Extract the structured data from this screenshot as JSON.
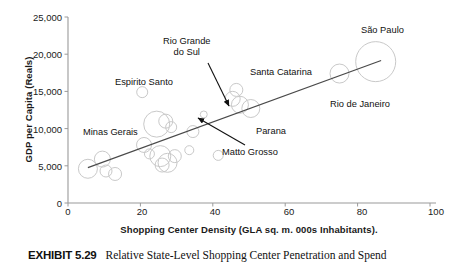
{
  "exhibit": {
    "label": "EXHIBIT 5.29",
    "caption": "Relative State-Level Shopping Center Penetration and Spend"
  },
  "chart_data": {
    "type": "scatter",
    "title": "",
    "xlabel": "Shopping Center Density (GLA sq. m. 000s Inhabitants).",
    "ylabel": "GDP per Capita (Reals)",
    "xlim": [
      0,
      100
    ],
    "ylim": [
      0,
      25000
    ],
    "xticks": [
      "0",
      "20",
      "40",
      "60",
      "80",
      "100"
    ],
    "xtick_values": [
      0,
      20,
      40,
      60,
      80,
      100
    ],
    "yticks": [
      "0",
      "5,000",
      "10,000",
      "15,000",
      "20,000",
      "25,000"
    ],
    "ytick_values": [
      0,
      5000,
      10000,
      15000,
      20000,
      25000
    ],
    "grid": false,
    "legend": "none",
    "bubble_color": "#c9c9c9",
    "trendline_color": "#4a4a4a",
    "series": [
      {
        "name": "Brazilian states",
        "marker": "open-circle",
        "points": [
          {
            "x": 5.5,
            "y": 4600,
            "r": 9.5
          },
          {
            "x": 9.5,
            "y": 5900,
            "r": 8.0
          },
          {
            "x": 10.5,
            "y": 4300,
            "r": 6.0
          },
          {
            "x": 13.0,
            "y": 3900,
            "r": 6.5
          },
          {
            "x": 20.5,
            "y": 14900,
            "r": 5.5
          },
          {
            "x": 21.0,
            "y": 7800,
            "r": 7.5
          },
          {
            "x": 22.5,
            "y": 6600,
            "r": 5.0
          },
          {
            "x": 24.5,
            "y": 10600,
            "r": 13.0
          },
          {
            "x": 25.5,
            "y": 6300,
            "r": 10.5
          },
          {
            "x": 26.0,
            "y": 5100,
            "r": 7.0
          },
          {
            "x": 27.0,
            "y": 11000,
            "r": 7.0
          },
          {
            "x": 27.5,
            "y": 5400,
            "r": 9.5
          },
          {
            "x": 28.5,
            "y": 10200,
            "r": 5.5
          },
          {
            "x": 29.5,
            "y": 6300,
            "r": 6.5
          },
          {
            "x": 33.5,
            "y": 7100,
            "r": 4.5
          },
          {
            "x": 34.5,
            "y": 9600,
            "r": 6.0
          },
          {
            "x": 37.5,
            "y": 11900,
            "r": 3.5
          },
          {
            "x": 41.5,
            "y": 6400,
            "r": 5.0
          },
          {
            "x": 45.5,
            "y": 14000,
            "r": 7.5
          },
          {
            "x": 46.5,
            "y": 15200,
            "r": 6.5
          },
          {
            "x": 47.5,
            "y": 13200,
            "r": 8.5
          },
          {
            "x": 50.5,
            "y": 12700,
            "r": 9.0
          },
          {
            "x": 75.0,
            "y": 17400,
            "r": 9.5
          },
          {
            "x": 85.0,
            "y": 19000,
            "r": 20.0
          }
        ]
      }
    ],
    "trendline": {
      "x0": 5.5,
      "y0": 4750,
      "x1": 86.5,
      "y1": 19150
    },
    "annotations": [
      {
        "id": "espirito-santo",
        "text": "Espirito Santo",
        "x": 115,
        "y": 77,
        "arrow": false
      },
      {
        "id": "rio-grande-do-sul",
        "text": "Rio Grande",
        "text2": "do Sul",
        "x": 163,
        "y": 36,
        "arrow": true,
        "arrow_from": [
          208,
          63
        ],
        "arrow_to": [
          229,
          106
        ]
      },
      {
        "id": "santa-catarina",
        "text": "Santa Catarina",
        "x": 250,
        "y": 67,
        "arrow": false
      },
      {
        "id": "sao-paulo",
        "text": "São Paulo",
        "x": 361,
        "y": 25,
        "arrow": false
      },
      {
        "id": "rio-de-janeiro",
        "text": "Rio de Janeiro",
        "x": 330,
        "y": 99,
        "arrow": false
      },
      {
        "id": "minas-gerais",
        "text": "Minas Gerais",
        "x": 83,
        "y": 127,
        "arrow": false
      },
      {
        "id": "parana",
        "text": "Parana",
        "x": 256,
        "y": 126,
        "arrow": false
      },
      {
        "id": "matto-grosso",
        "text": "Matto Grosso",
        "x": 222,
        "y": 147,
        "arrow": true,
        "arrow_from": [
          245,
          145
        ],
        "arrow_to": [
          198,
          118
        ]
      }
    ]
  }
}
